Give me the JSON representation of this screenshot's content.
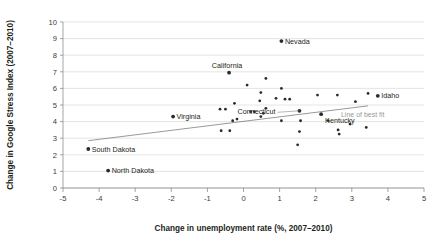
{
  "chart_data": {
    "type": "scatter",
    "title": "",
    "xlabel": "Change in unemployment rate (%, 2007–2010)",
    "ylabel": "Change in Google Stress Index (2007–2010)",
    "xlim": [
      -5,
      5
    ],
    "ylim": [
      0,
      10
    ],
    "xticks": [
      -5,
      -4,
      -3,
      -2,
      -1,
      0,
      1,
      2,
      3,
      4,
      5
    ],
    "xtick_labels": [
      "-5",
      "-4",
      "-3",
      "-2",
      "-1",
      "0",
      "1",
      "2",
      "3",
      "4",
      "5"
    ],
    "yticks": [
      0,
      1,
      2,
      3,
      4,
      5,
      6,
      7,
      8,
      9,
      10
    ],
    "ytick_labels": [
      "0",
      "1",
      "2",
      "3",
      "4",
      "5",
      "6",
      "7",
      "8",
      "9",
      "10"
    ],
    "grid": "horizontal",
    "legend": "none",
    "series": [
      {
        "name": "US states",
        "points": [
          {
            "x": 1.05,
            "y": 8.85,
            "label": "Nevada",
            "label_pos": "right"
          },
          {
            "x": -0.4,
            "y": 6.95,
            "label": "California",
            "label_pos": "above-left"
          },
          {
            "x": 3.72,
            "y": 5.55,
            "label": "Idaho",
            "label_pos": "right"
          },
          {
            "x": 1.55,
            "y": 4.65,
            "label": "Connecticut",
            "label_pos": "leader-left"
          },
          {
            "x": 2.15,
            "y": 4.45,
            "label": "Kentucky",
            "label_pos": "below-right"
          },
          {
            "x": -1.95,
            "y": 4.3,
            "label": "Virginia",
            "label_pos": "right"
          },
          {
            "x": -4.3,
            "y": 2.35,
            "label": "South Dakota",
            "label_pos": "right"
          },
          {
            "x": -3.75,
            "y": 1.05,
            "label": "North Dakota",
            "label_pos": "right"
          },
          {
            "x": 0.62,
            "y": 6.6,
            "label": null
          },
          {
            "x": 0.1,
            "y": 6.2,
            "label": null
          },
          {
            "x": 1.05,
            "y": 6.0,
            "label": null
          },
          {
            "x": 0.48,
            "y": 5.75,
            "label": null
          },
          {
            "x": 2.05,
            "y": 5.6,
            "label": null
          },
          {
            "x": 2.6,
            "y": 5.6,
            "label": null
          },
          {
            "x": 3.45,
            "y": 5.7,
            "label": null
          },
          {
            "x": 0.9,
            "y": 5.4,
            "label": null
          },
          {
            "x": 1.15,
            "y": 5.35,
            "label": null
          },
          {
            "x": 1.28,
            "y": 5.35,
            "label": null
          },
          {
            "x": 0.45,
            "y": 5.25,
            "label": null
          },
          {
            "x": -0.25,
            "y": 5.1,
            "label": null
          },
          {
            "x": 3.1,
            "y": 5.2,
            "label": null
          },
          {
            "x": 0.62,
            "y": 4.8,
            "label": null
          },
          {
            "x": -0.65,
            "y": 4.75,
            "label": null
          },
          {
            "x": -0.5,
            "y": 4.75,
            "label": null
          },
          {
            "x": 0.2,
            "y": 4.6,
            "label": null
          },
          {
            "x": 0.3,
            "y": 4.6,
            "label": null
          },
          {
            "x": 0.55,
            "y": 4.5,
            "label": null
          },
          {
            "x": 0.48,
            "y": 4.3,
            "label": null
          },
          {
            "x": -0.3,
            "y": 4.05,
            "label": null
          },
          {
            "x": -0.18,
            "y": 4.15,
            "label": null
          },
          {
            "x": 1.05,
            "y": 4.05,
            "label": null
          },
          {
            "x": 1.58,
            "y": 4.05,
            "label": null
          },
          {
            "x": 2.35,
            "y": 4.05,
            "label": null
          },
          {
            "x": 2.95,
            "y": 3.85,
            "label": null
          },
          {
            "x": -0.62,
            "y": 3.45,
            "label": null
          },
          {
            "x": -0.38,
            "y": 3.45,
            "label": null
          },
          {
            "x": 1.55,
            "y": 3.4,
            "label": null
          },
          {
            "x": 2.62,
            "y": 3.5,
            "label": null
          },
          {
            "x": 3.4,
            "y": 3.65,
            "label": null
          },
          {
            "x": 2.65,
            "y": 3.25,
            "label": null
          },
          {
            "x": 1.5,
            "y": 2.6,
            "label": null
          }
        ]
      }
    ],
    "annotations": [
      {
        "text": "Line of best fit",
        "x": 2.7,
        "y": 4.45
      }
    ],
    "fit_line": {
      "x0": -4.3,
      "y0": 2.85,
      "x1": 3.45,
      "y1": 4.95
    }
  }
}
